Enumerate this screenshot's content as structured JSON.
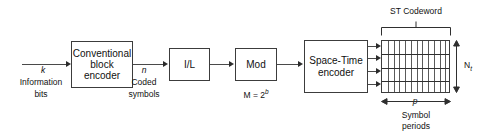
{
  "diagram": {
    "blocks": [
      {
        "id": "conv-block-encoder",
        "lines": [
          "Conventional",
          "block",
          "encoder"
        ]
      },
      {
        "id": "interleaver",
        "lines": [
          "I/L"
        ]
      },
      {
        "id": "modulator",
        "lines": [
          "Mod"
        ]
      },
      {
        "id": "space-time-encoder",
        "lines": [
          "Space-Time",
          "encoder"
        ]
      }
    ],
    "labels": {
      "input_symbol": "k",
      "input_caption_line1": "Information",
      "input_caption_line2": "bits",
      "coded_symbol": "n",
      "coded_caption_line1": "Coded",
      "coded_caption_line2": "symbols",
      "mod_order_prefix": "M = 2",
      "mod_order_exponent": "b",
      "codeword_bracket": "ST Codeword",
      "rows_symbol": "N",
      "rows_subscript": "t",
      "cols_symbol": "p",
      "cols_caption_line1": "Symbol",
      "cols_caption_line2": "periods"
    },
    "matrix": {
      "columns": 12,
      "rows": 4,
      "antenna_streams": 4
    },
    "colors": {
      "background": "#ffffff",
      "stroke": "#3c3c3c",
      "wire": "#4a4a4a",
      "text": "#111111"
    }
  }
}
